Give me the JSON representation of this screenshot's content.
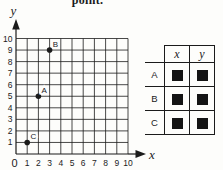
{
  "page": {
    "instruction_fragment": "point.",
    "ink_color": "#1b1b1b",
    "background": "#fdfdfb"
  },
  "chart_data": {
    "type": "scatter",
    "title": "",
    "xlabel": "x",
    "ylabel": "y",
    "xlim": [
      0,
      10
    ],
    "ylim": [
      0,
      10
    ],
    "x_ticks": [
      0,
      1,
      2,
      3,
      4,
      5,
      6,
      7,
      8,
      9,
      10
    ],
    "y_ticks": [
      1,
      2,
      3,
      4,
      5,
      6,
      7,
      8,
      9,
      10
    ],
    "grid": true,
    "points": [
      {
        "label": "A",
        "x": 2,
        "y": 5
      },
      {
        "label": "B",
        "x": 3,
        "y": 9
      },
      {
        "label": "C",
        "x": 1,
        "y": 1
      }
    ]
  },
  "table": {
    "column_headers": [
      "x",
      "y"
    ],
    "rows": [
      {
        "label": "A",
        "cells": [
          "filled-square",
          "filled-square"
        ]
      },
      {
        "label": "B",
        "cells": [
          "filled-square",
          "filled-square"
        ]
      },
      {
        "label": "C",
        "cells": [
          "filled-square",
          "filled-square"
        ]
      }
    ],
    "placeholder_icon": "filled-square"
  }
}
